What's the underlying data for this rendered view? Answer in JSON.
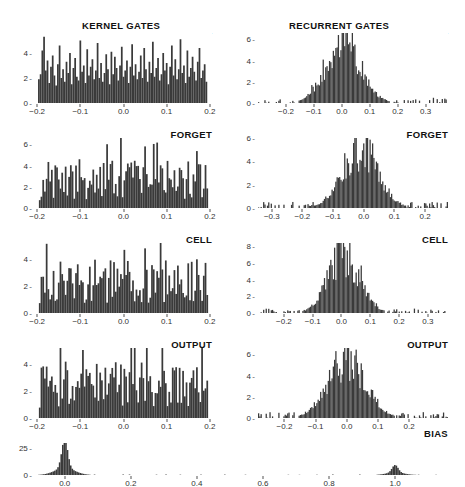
{
  "figure": {
    "columns": [
      {
        "id": "kernel",
        "heading": "KERNEL GATES"
      },
      {
        "id": "recurrent",
        "heading": "RECURRENT GATES"
      }
    ],
    "row_labels": [
      "INPUT",
      "FORGET",
      "CELL",
      "OUTPUT"
    ],
    "bias_label": "BIAS",
    "bar_color": "#3a3a3a",
    "axis_color": "#555555",
    "background": "#ffffff"
  },
  "chart_data": [
    {
      "id": "kernel-input",
      "type": "bar",
      "title": "INPUT",
      "group": "KERNEL GATES",
      "xlabel": "",
      "ylabel": "",
      "xlim": [
        -0.205,
        0.205
      ],
      "ylim": [
        0,
        5.6
      ],
      "xticks": [
        -0.2,
        -0.1,
        0.0,
        0.1,
        0.2
      ],
      "xticklabels": [
        "−0.2",
        "−0.1",
        "0.0",
        "0.1",
        "0.2"
      ],
      "yticks": [
        0,
        2,
        4
      ],
      "yticklabels": [
        "0",
        "2",
        "4"
      ],
      "grid": false,
      "distribution": "uniform",
      "bin_centers": [
        -0.196,
        -0.192,
        -0.188,
        -0.184,
        -0.18,
        -0.176,
        -0.172,
        -0.168,
        -0.164,
        -0.16,
        -0.156,
        -0.152,
        -0.148,
        -0.144,
        -0.14,
        -0.136,
        -0.132,
        -0.128,
        -0.124,
        -0.12,
        -0.116,
        -0.112,
        -0.108,
        -0.104,
        -0.1,
        -0.096,
        -0.092,
        -0.088,
        -0.084,
        -0.08,
        -0.076,
        -0.072,
        -0.068,
        -0.064,
        -0.06,
        -0.056,
        -0.052,
        -0.048,
        -0.044,
        -0.04,
        -0.036,
        -0.032,
        -0.028,
        -0.024,
        -0.02,
        -0.016,
        -0.012,
        -0.008,
        -0.004,
        0.0,
        0.004,
        0.008,
        0.012,
        0.016,
        0.02,
        0.024,
        0.028,
        0.032,
        0.036,
        0.04,
        0.044,
        0.048,
        0.052,
        0.056,
        0.06,
        0.064,
        0.068,
        0.072,
        0.076,
        0.08,
        0.084,
        0.088,
        0.092,
        0.096,
        0.1,
        0.104,
        0.108,
        0.112,
        0.116,
        0.12,
        0.124,
        0.128,
        0.132,
        0.136,
        0.14,
        0.144,
        0.148,
        0.152,
        0.156,
        0.16,
        0.164,
        0.168,
        0.172,
        0.176,
        0.18,
        0.184,
        0.188,
        0.192,
        0.196
      ],
      "values": [
        1.9,
        2.3,
        4.2,
        5.3,
        2.6,
        3.4,
        1.6,
        2.9,
        3.8,
        2.2,
        1.4,
        3.1,
        4.6,
        2.0,
        2.7,
        1.7,
        3.3,
        2.4,
        4.0,
        1.5,
        2.8,
        3.6,
        2.1,
        1.8,
        5.0,
        2.5,
        3.0,
        1.6,
        4.3,
        2.2,
        2.9,
        3.5,
        1.9,
        2.6,
        4.8,
        2.0,
        3.2,
        1.7,
        2.4,
        3.9,
        2.7,
        1.5,
        4.1,
        2.3,
        3.7,
        2.8,
        1.8,
        3.0,
        4.5,
        2.1,
        2.6,
        3.4,
        1.6,
        2.9,
        4.7,
        2.2,
        3.1,
        1.9,
        2.5,
        3.8,
        2.0,
        4.4,
        2.7,
        1.7,
        3.3,
        2.4,
        4.9,
        2.1,
        2.8,
        3.6,
        1.8,
        2.3,
        4.0,
        2.6,
        3.2,
        1.5,
        2.9,
        4.6,
        2.2,
        3.5,
        1.9,
        2.7,
        5.1,
        2.4,
        3.0,
        1.6,
        4.2,
        2.1,
        2.8,
        3.7,
        2.5,
        1.8,
        3.3,
        4.4,
        2.0,
        2.6,
        3.1,
        1.7
      ]
    },
    {
      "id": "recurrent-input",
      "type": "bar",
      "title": "INPUT",
      "group": "RECURRENT GATES",
      "xlabel": "",
      "ylabel": "",
      "xlim": [
        -0.3,
        0.38
      ],
      "ylim": [
        0,
        6.6
      ],
      "xticks": [
        -0.2,
        -0.1,
        0.0,
        0.1,
        0.2,
        0.3
      ],
      "xticklabels": [
        "−0.2",
        "−0.1",
        "0.0",
        "0.1",
        "0.2",
        "0.3"
      ],
      "yticks": [
        0,
        2,
        4,
        6
      ],
      "yticklabels": [
        "0",
        "2",
        "4",
        "6"
      ],
      "grid": false,
      "distribution": "gaussian",
      "gaussian": {
        "mean": 0.005,
        "sigma": 0.062,
        "peak": 5.6,
        "noise": 0.85
      }
    },
    {
      "id": "kernel-forget",
      "type": "bar",
      "title": "FORGET",
      "group": "KERNEL GATES",
      "xlim": [
        -0.205,
        0.205
      ],
      "ylim": [
        0,
        6.6
      ],
      "xticks": [
        -0.2,
        -0.1,
        0.0,
        0.1,
        0.2
      ],
      "xticklabels": [
        "−0.2",
        "−0.1",
        "0.0",
        "0.1",
        "0.2"
      ],
      "yticks": [
        0,
        2,
        4,
        6
      ],
      "yticklabels": [
        "0",
        "2",
        "4",
        "6"
      ],
      "grid": false,
      "distribution": "uniform",
      "uniform": {
        "base": 2.3,
        "spread": 2.4,
        "seed": 7
      }
    },
    {
      "id": "recurrent-forget",
      "type": "bar",
      "title": "FORGET",
      "group": "RECURRENT GATES",
      "xlim": [
        -0.345,
        0.275
      ],
      "ylim": [
        0,
        6.0
      ],
      "xticks": [
        -0.3,
        -0.2,
        -0.1,
        0.0,
        0.1,
        0.2
      ],
      "xticklabels": [
        "−0.3",
        "−0.2",
        "−0.1",
        "0.0",
        "0.1",
        "0.2"
      ],
      "yticks": [
        0,
        2,
        4,
        6
      ],
      "yticklabels": [
        "0",
        "2",
        "4",
        "6"
      ],
      "grid": false,
      "distribution": "gaussian",
      "gaussian": {
        "mean": -0.012,
        "sigma": 0.058,
        "peak": 5.2,
        "noise": 0.85
      }
    },
    {
      "id": "kernel-cell",
      "type": "bar",
      "title": "CELL",
      "group": "KERNEL GATES",
      "xlim": [
        -0.205,
        0.205
      ],
      "ylim": [
        0,
        5.2
      ],
      "xticks": [
        -0.2,
        -0.1,
        0.0,
        0.1,
        0.2
      ],
      "xticklabels": [
        "−0.2",
        "−0.1",
        "0.0",
        "0.1",
        "0.2"
      ],
      "yticks": [
        0,
        2,
        4
      ],
      "yticklabels": [
        "0",
        "2",
        "4"
      ],
      "grid": false,
      "distribution": "uniform",
      "uniform": {
        "base": 2.1,
        "spread": 2.1,
        "seed": 13
      }
    },
    {
      "id": "recurrent-cell",
      "type": "bar",
      "title": "CELL",
      "group": "RECURRENT GATES",
      "xlim": [
        -0.29,
        0.37
      ],
      "ylim": [
        0,
        8.4
      ],
      "xticks": [
        -0.2,
        -0.1,
        0.0,
        0.1,
        0.2,
        0.3
      ],
      "xticklabels": [
        "−0.2",
        "−0.1",
        "0.0",
        "0.1",
        "0.2",
        "0.3"
      ],
      "yticks": [
        0,
        2,
        4,
        6,
        8
      ],
      "yticklabels": [
        "0",
        "2",
        "4",
        "6",
        "8"
      ],
      "grid": false,
      "distribution": "gaussian",
      "gaussian": {
        "mean": 0.008,
        "sigma": 0.055,
        "peak": 7.0,
        "noise": 0.85
      }
    },
    {
      "id": "kernel-output",
      "type": "bar",
      "title": "OUTPUT",
      "group": "KERNEL GATES",
      "xlim": [
        -0.205,
        0.205
      ],
      "ylim": [
        0,
        5.2
      ],
      "xticks": [
        -0.2,
        -0.1,
        0.0,
        0.1,
        0.2
      ],
      "xticklabels": [
        "−0.2",
        "−0.1",
        "0.0",
        "0.1",
        "0.2"
      ],
      "yticks": [
        0,
        2,
        4
      ],
      "yticklabels": [
        "0",
        "2",
        "4"
      ],
      "grid": false,
      "distribution": "uniform",
      "uniform": {
        "base": 2.2,
        "spread": 2.2,
        "seed": 23
      }
    },
    {
      "id": "recurrent-output",
      "type": "bar",
      "title": "OUTPUT",
      "group": "RECURRENT GATES",
      "xlim": [
        -0.285,
        0.325
      ],
      "ylim": [
        0,
        6.6
      ],
      "xticks": [
        -0.2,
        -0.1,
        0.0,
        0.1,
        0.2
      ],
      "xticklabels": [
        "−0.2",
        "−0.1",
        "0.0",
        "0.1",
        "0.2"
      ],
      "yticks": [
        0,
        2,
        4,
        6
      ],
      "yticklabels": [
        "0",
        "2",
        "4",
        "6"
      ],
      "grid": false,
      "distribution": "gaussian",
      "gaussian": {
        "mean": 0.0,
        "sigma": 0.06,
        "peak": 5.7,
        "noise": 0.85
      }
    },
    {
      "id": "bias",
      "type": "bar",
      "title": "BIAS",
      "group": "",
      "xlim": [
        -0.09,
        1.16
      ],
      "ylim": [
        0,
        30
      ],
      "xticks": [
        0.0,
        0.2,
        0.4,
        0.6,
        0.8,
        1.0
      ],
      "xticklabels": [
        "0.0",
        "0.2",
        "0.4",
        "0.6",
        "0.8",
        "1.0"
      ],
      "yticks": [
        0,
        25
      ],
      "yticklabels": [
        "0",
        "25"
      ],
      "grid": false,
      "distribution": "spikes",
      "spikes": [
        {
          "center": 0.0,
          "height": 27.0,
          "width": 0.009
        },
        {
          "center": 0.0,
          "height": 6.5,
          "width": 0.03
        },
        {
          "center": 1.0,
          "height": 7.0,
          "width": 0.009
        },
        {
          "center": 1.0,
          "height": 2.4,
          "width": 0.026
        }
      ]
    }
  ]
}
